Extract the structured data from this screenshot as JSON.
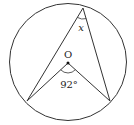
{
  "diagram": {
    "type": "circle-geometry",
    "center_label": "O",
    "central_angle_label": "92°",
    "inscribed_angle_label": "x",
    "colors": {
      "stroke": "#333333",
      "text": "#222222",
      "background": "#ffffff"
    }
  }
}
